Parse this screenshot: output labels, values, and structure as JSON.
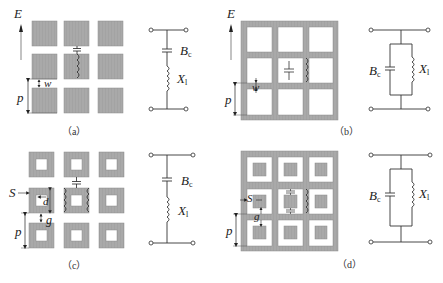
{
  "figure": {
    "panels": [
      {
        "id": "a",
        "caption": "（a）",
        "structure": "square metal patches array",
        "labels": {
          "field": "E",
          "period": "p",
          "gap": "w"
        },
        "circuit": {
          "type": "series",
          "capacitor": "B",
          "capacitor_sub": "c",
          "inductor": "X",
          "inductor_sub": "l"
        }
      },
      {
        "id": "b",
        "caption": "（b）",
        "structure": "metal grid (square apertures)",
        "labels": {
          "field": "E",
          "period": "p",
          "gap": "w"
        },
        "circuit": {
          "type": "parallel",
          "capacitor": "B",
          "capacitor_sub": "c",
          "inductor": "X",
          "inductor_sub": "l"
        }
      },
      {
        "id": "c",
        "caption": "（c）",
        "structure": "square loop array",
        "labels": {
          "strip": "S",
          "size": "d",
          "gap": "g",
          "period": "p"
        },
        "circuit": {
          "type": "series",
          "capacitor": "B",
          "capacitor_sub": "c",
          "inductor": "X",
          "inductor_sub": "l"
        }
      },
      {
        "id": "d",
        "caption": "（d）",
        "structure": "grid with square patches in apertures",
        "labels": {
          "strip": "S",
          "gap": "g",
          "period": "p"
        },
        "circuit": {
          "type": "parallel",
          "capacitor": "B",
          "capacitor_sub": "c",
          "inductor": "X",
          "inductor_sub": "l"
        }
      }
    ]
  },
  "colors": {
    "metal": "#a8a8a8",
    "metal_edge": "#8c8c8c",
    "wire": "#333333"
  }
}
